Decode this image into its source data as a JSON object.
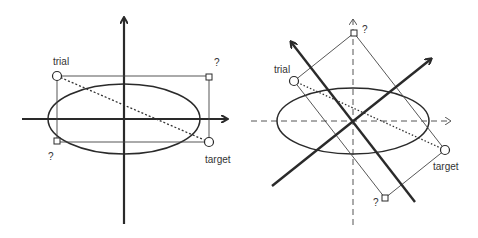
{
  "colors": {
    "stroke": "#2a2a2a",
    "thin": "#444444",
    "text": "#333333",
    "background": "#ffffff"
  },
  "left_panel": {
    "labels": {
      "trial": "trial",
      "target": "target",
      "unknown_top_right": "?",
      "unknown_bottom_left": "?"
    }
  },
  "right_panel": {
    "labels": {
      "trial": "trial",
      "target": "target",
      "unknown_top": "?",
      "unknown_bottom": "?"
    }
  }
}
